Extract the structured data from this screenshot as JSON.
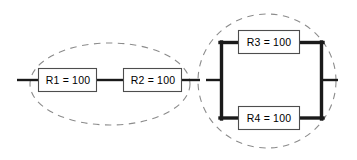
{
  "diagram": {
    "background_color": "#ffffff",
    "wire_color": "#1a1a1a",
    "box_stroke_color": "#4d4d4d",
    "box_fill_color": "#ffffff",
    "group_outline_color": "#8c8c8c",
    "label_color": "#000000",
    "components": [
      {
        "id": "R1",
        "label": "R1 = 100",
        "value": "100",
        "group": "series-group",
        "box": {
          "x": 38,
          "y": 68,
          "width": 59,
          "height": 24
        }
      },
      {
        "id": "R2",
        "label": "R2 = 100",
        "value": "100",
        "group": "series-group",
        "box": {
          "x": 123,
          "y": 68,
          "width": 59,
          "height": 24
        }
      },
      {
        "id": "R3",
        "label": "R3 = 100",
        "value": "100",
        "group": "parallel-group",
        "box": {
          "x": 238,
          "y": 30,
          "width": 62,
          "height": 24
        }
      },
      {
        "id": "R4",
        "label": "R4 = 100",
        "value": "100",
        "group": "parallel-group",
        "box": {
          "x": 238,
          "y": 106,
          "width": 62,
          "height": 24
        }
      }
    ],
    "groups": [
      {
        "id": "series-group",
        "shape": "ellipse",
        "style": "dashed",
        "cx": 110,
        "cy": 84,
        "rx": 80,
        "ry": 41
      },
      {
        "id": "parallel-group",
        "shape": "circle",
        "style": "dashed",
        "cx": 267,
        "cy": 81,
        "rx": 69,
        "ry": 67
      }
    ],
    "terminals": [
      {
        "id": "left-terminal",
        "x1": 18,
        "y1": 80,
        "x2": 38,
        "y2": 80
      },
      {
        "id": "right-terminal",
        "x1": 322,
        "y1": 80,
        "x2": 337,
        "y2": 80
      }
    ]
  }
}
